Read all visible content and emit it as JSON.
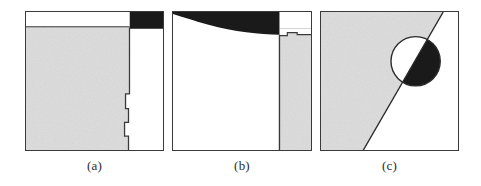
{
  "figure": {
    "width": 481,
    "height": 186,
    "background_color": "#ffffff",
    "panel_count": 3
  },
  "style": {
    "border_color": "#3a3a3a",
    "gray_fill": "#dcdcdc",
    "black_fill": "#1a1a1a",
    "white_fill": "#ffffff",
    "caption_color": "#2b2b2b"
  },
  "panels": [
    {
      "id": "a",
      "caption": "(a)",
      "description": "rectangular frame with a thin white strip across the upper left, a solid black bar filling the upper right, a large light-gray region occupying the left two thirds with a stepped right boundary, and white elsewhere",
      "regions": [
        {
          "name": "white-top-strip",
          "fill": "#ffffff"
        },
        {
          "name": "black-top-right-bar",
          "fill": "#1a1a1a"
        },
        {
          "name": "gray-left-region",
          "fill": "#dcdcdc"
        },
        {
          "name": "white-right-region",
          "fill": "#ffffff"
        }
      ]
    },
    {
      "id": "b",
      "caption": "(b)",
      "description": "rectangular frame with a solid black band across the top whose lower edge sags into a shallow concave curve, a narrow white notch at the top right, a light-gray column down the right side with a small stepped upper edge, and white filling the remaining interior",
      "regions": [
        {
          "name": "black-top-band-curved",
          "fill": "#1a1a1a"
        },
        {
          "name": "white-top-right-notch",
          "fill": "#ffffff"
        },
        {
          "name": "gray-right-column",
          "fill": "#dcdcdc"
        },
        {
          "name": "white-main-region",
          "fill": "#ffffff"
        }
      ]
    },
    {
      "id": "c",
      "caption": "(c)",
      "description": "rectangular frame split by a straight diagonal line running from lower left to upper right; light gray fills the upper-left side and white the lower-right side; a circle straddles the diagonal near the upper right with its upper-left half white and its lower-right half solid black",
      "regions": [
        {
          "name": "gray-upper-left-half",
          "fill": "#dcdcdc"
        },
        {
          "name": "white-lower-right-half",
          "fill": "#ffffff"
        },
        {
          "name": "diagonal-divider-line",
          "fill": "#2b2b2b"
        },
        {
          "name": "circle-white-half",
          "fill": "#ffffff"
        },
        {
          "name": "circle-black-half",
          "fill": "#1a1a1a"
        }
      ]
    }
  ]
}
